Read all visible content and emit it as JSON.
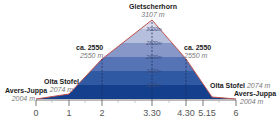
{
  "diagram": {
    "type": "elevation-profile",
    "colors": {
      "outline": "#c0504d",
      "band_2200": "#143f8c",
      "band_2400": "#2f5aa3",
      "band_2600": "#5573b5",
      "band_2800": "#8797c7",
      "band_3000": "#b6bfdc",
      "band_top": "#d8dcec",
      "axis": "#555555"
    },
    "summit": {
      "name": "Gletscherhorn",
      "elevation": "3107 m"
    },
    "waypoints_left": [
      {
        "name": "Avers-Juppa",
        "elevation": "2004 m"
      },
      {
        "name": "Olta Stofel",
        "elevation": "2074 m"
      },
      {
        "name": "ca. 2550",
        "elevation": "2550 m"
      }
    ],
    "waypoints_right": [
      {
        "name": "ca. 2550",
        "elevation": "2550 m"
      },
      {
        "name": "Olta Stofel",
        "elevation": "2074 m"
      },
      {
        "name": "Avers-Juppa",
        "elevation": "2004 m"
      }
    ],
    "altitude_bands": [
      "3000m",
      "2800m",
      "2600m",
      "2400m",
      "2200m"
    ],
    "time_axis": [
      "0",
      "1",
      "2",
      "3.30",
      "4.30",
      "5.15",
      "6"
    ]
  }
}
